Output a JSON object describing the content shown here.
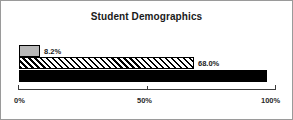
{
  "chart_data": {
    "type": "bar",
    "orientation": "horizontal",
    "title": "Student Demographics",
    "xlabel": "",
    "ylabel": "",
    "xlim": [
      0,
      100
    ],
    "grid": false,
    "legend": false,
    "categories": [
      "series-1",
      "series-2",
      "series-3"
    ],
    "values": [
      8.2,
      68.0,
      96.4
    ],
    "data_labels": [
      "8.2%",
      "68.0%",
      "96.4%"
    ],
    "bars": [
      {
        "value": 8.2,
        "label": "8.2%",
        "fill": "gray",
        "fill_color": "#b8b8b8",
        "label_position": "outside",
        "label_color": "#1a1a1a"
      },
      {
        "value": 68.0,
        "label": "68.0%",
        "fill": "hatched",
        "fill_color": "#ffffff",
        "label_position": "outside",
        "label_color": "#1a1a1a"
      },
      {
        "value": 96.4,
        "label": "96.4%",
        "fill": "solid",
        "fill_color": "#000000",
        "label_position": "inside",
        "label_color": "#ffffff"
      }
    ],
    "x_ticks": [
      0,
      50,
      100
    ],
    "x_tick_labels": [
      "0%",
      "50%",
      "100%"
    ]
  },
  "axis": {
    "tick_0": "0%",
    "tick_50": "50%",
    "tick_100": "100%"
  },
  "colors": {
    "frame_border": "#9a9a9a",
    "axis": "#3c3c3c",
    "background": "#ffffff",
    "bar_outline": "#000000"
  }
}
